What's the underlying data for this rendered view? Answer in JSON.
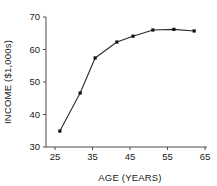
{
  "chart_data": {
    "type": "line",
    "title": "",
    "xlabel": "AGE (YEARS)",
    "ylabel": "INCOME ($1,000s)",
    "xlim": [
      25,
      65
    ],
    "ylim": [
      30,
      70
    ],
    "xticks": [
      25,
      35,
      45,
      55,
      65
    ],
    "yticks": [
      30,
      40,
      50,
      60,
      70
    ],
    "xtick_labels": [
      "25",
      "35",
      "45",
      "55",
      "65"
    ],
    "ytick_labels": [
      "30",
      "40",
      "50",
      "60",
      "70"
    ],
    "grid": false,
    "legend": null,
    "marker": "square",
    "line_color": "#2b2b2b",
    "marker_color": "#111111",
    "x": [
      26.3,
      31.7,
      35.7,
      41.5,
      45.8,
      51.1,
      56.7,
      62.1
    ],
    "values": [
      34.9,
      46.6,
      57.4,
      62.3,
      64.1,
      66.0,
      66.2,
      65.7
    ],
    "points": [
      {
        "x": 26.3,
        "y": 34.9
      },
      {
        "x": 31.7,
        "y": 46.6
      },
      {
        "x": 35.7,
        "y": 57.4
      },
      {
        "x": 41.5,
        "y": 62.3
      },
      {
        "x": 45.8,
        "y": 64.1
      },
      {
        "x": 51.1,
        "y": 66.0
      },
      {
        "x": 56.7,
        "y": 66.2
      },
      {
        "x": 62.1,
        "y": 65.7
      }
    ]
  }
}
